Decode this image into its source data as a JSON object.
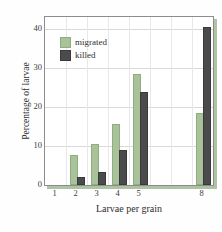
{
  "chart_data": {
    "type": "bar",
    "title": "",
    "subtitle": "",
    "xlabel": "Larvae per grain",
    "ylabel": "Percentage of larvae",
    "categories": [
      "1",
      "2",
      "3",
      "4",
      "5",
      "8"
    ],
    "series": [
      {
        "name": "migrated",
        "color": "#a9c29a",
        "values": [
          0,
          7.2,
          10.0,
          15.1,
          27.8,
          18.0
        ]
      },
      {
        "name": "killed",
        "color": "#4b4b4b",
        "values": [
          0,
          1.5,
          2.8,
          8.5,
          23.4,
          40.0
        ]
      }
    ],
    "ylim": [
      0,
      43
    ],
    "yticks": [
      0,
      10,
      20,
      30,
      40
    ],
    "ytick_labels": [
      "0",
      "10",
      "20",
      "30",
      "40"
    ],
    "grid": true,
    "grid_axis": "y",
    "legend_position": "upper-left",
    "legend_entries": [
      "migrated",
      "killed"
    ]
  },
  "caption": {
    "text": ""
  }
}
